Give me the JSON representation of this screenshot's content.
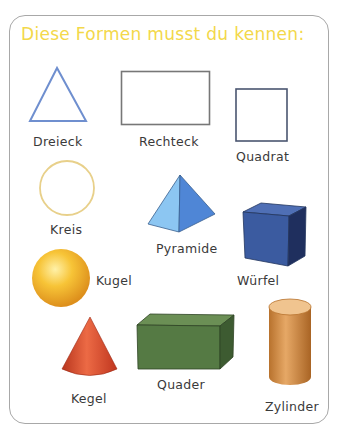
{
  "title": "Diese Formen musst du kennen:",
  "shapes": [
    {
      "id": "dreieck",
      "label": "Dreieck",
      "kind": "2d",
      "color": "#6f8fcf"
    },
    {
      "id": "rechteck",
      "label": "Rechteck",
      "kind": "2d",
      "color": "#6e6e6e"
    },
    {
      "id": "quadrat",
      "label": "Quadrat",
      "kind": "2d",
      "color": "#4a5570"
    },
    {
      "id": "kreis",
      "label": "Kreis",
      "kind": "2d",
      "color": "#e8d08a"
    },
    {
      "id": "pyramide",
      "label": "Pyramide",
      "kind": "3d",
      "color": "#5b9be0"
    },
    {
      "id": "wuerfel",
      "label": "Würfel",
      "kind": "3d",
      "color": "#2f4a86"
    },
    {
      "id": "kugel",
      "label": "Kugel",
      "kind": "3d",
      "color": "#f5b52e"
    },
    {
      "id": "kegel",
      "label": "Kegel",
      "kind": "3d",
      "color": "#d9472a"
    },
    {
      "id": "quader",
      "label": "Quader",
      "kind": "3d",
      "color": "#4f7340"
    },
    {
      "id": "zylinder",
      "label": "Zylinder",
      "kind": "3d",
      "color": "#c98a45"
    }
  ]
}
